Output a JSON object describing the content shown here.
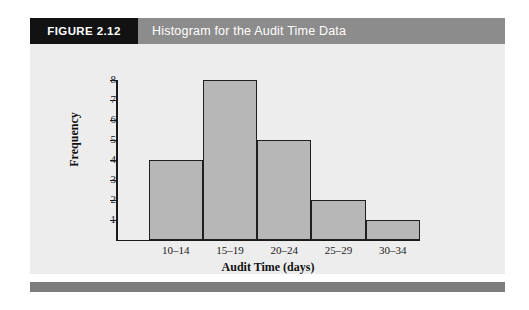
{
  "figure": {
    "number_label": "FIGURE 2.12",
    "caption": "Histogram for the Audit Time Data",
    "header_bg": "#8c8c8c",
    "tab_bg": "#121212",
    "panel_bg": "#ededed",
    "footer_rule_color": "#7d7d7d"
  },
  "chart_data": {
    "type": "bar",
    "title": "Histogram for the Audit Time Data",
    "categories": [
      "10–14",
      "15–19",
      "20–24",
      "25–29",
      "30–34"
    ],
    "values": [
      4,
      8,
      5,
      2,
      1
    ],
    "xlabel": "Audit Time (days)",
    "ylabel": "Frequency",
    "ylim": [
      0,
      8
    ],
    "yticks": [
      1,
      2,
      3,
      4,
      5,
      6,
      7,
      8
    ],
    "ytick_labels": [
      "1",
      "2",
      "3",
      "4",
      "5",
      "6",
      "7",
      "8"
    ],
    "grid": false,
    "legend": null,
    "bar_fill": "#b7b7b7",
    "bar_edge": "#1f1f1f",
    "axis_color": "#1a1a1a"
  }
}
